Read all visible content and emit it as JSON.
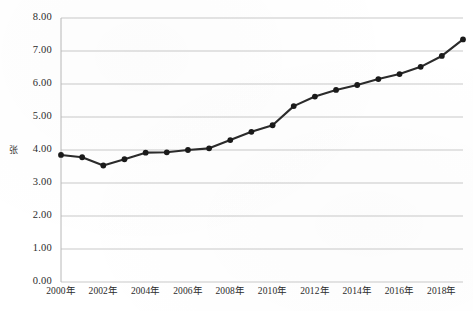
{
  "chart_data": {
    "type": "line",
    "title": "",
    "xlabel": "",
    "ylabel": "张",
    "ylim": [
      0.0,
      8.0
    ],
    "ytick_step": 1.0,
    "grid": true,
    "legend": false,
    "marker": "circle",
    "line_color": "#2b2b2b",
    "marker_color": "#1a1a1a",
    "grid_color": "#c9c9c9",
    "x": [
      "2000年",
      "2001年",
      "2002年",
      "2003年",
      "2004年",
      "2005年",
      "2006年",
      "2007年",
      "2008年",
      "2009年",
      "2010年",
      "2011年",
      "2012年",
      "2013年",
      "2014年",
      "2015年",
      "2016年",
      "2017年",
      "2018年",
      "2019年"
    ],
    "xtick_labels": [
      "2000年",
      "2002年",
      "2004年",
      "2006年",
      "2008年",
      "2010年",
      "2012年",
      "2014年",
      "2016年",
      "2018年"
    ],
    "ytick_labels": [
      "0.00",
      "1.00",
      "2.00",
      "3.00",
      "4.00",
      "5.00",
      "6.00",
      "7.00",
      "8.00"
    ],
    "ytick_values": [
      0.0,
      1.0,
      2.0,
      3.0,
      4.0,
      5.0,
      6.0,
      7.0,
      8.0
    ],
    "values": [
      3.85,
      3.78,
      3.53,
      3.72,
      3.92,
      3.93,
      4.0,
      4.05,
      4.3,
      4.55,
      4.75,
      5.33,
      5.62,
      5.82,
      5.97,
      6.15,
      6.3,
      6.52,
      6.85,
      7.22
    ],
    "last_value": 7.35,
    "series": [
      {
        "name": "张",
        "values": [
          3.85,
          3.78,
          3.53,
          3.72,
          3.92,
          3.93,
          4.0,
          4.05,
          4.3,
          4.55,
          4.75,
          5.33,
          5.62,
          5.82,
          5.97,
          6.15,
          6.3,
          6.52,
          6.85,
          7.35
        ]
      }
    ]
  }
}
